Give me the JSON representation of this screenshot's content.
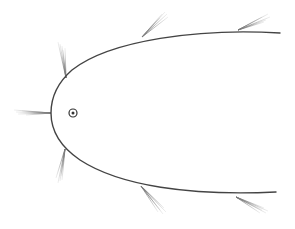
{
  "diagram": {
    "title": "Parabolic reflector with incoming rays and focus point",
    "curve": {
      "stroke": "#444444",
      "stroke_width": 1.4,
      "path": "M 280 33 C 200 28, 110 40, 72 70 C 55 85, 51 100, 51 113 C 51 128, 58 145, 80 160 C 120 186, 190 196, 276 192"
    },
    "focus": {
      "cx": 73,
      "cy": 113,
      "outer_r": 4,
      "inner_r": 1.5,
      "stroke": "#333333"
    },
    "feather_color": "#9a9a9a",
    "feathers": [
      {
        "name": "feather-left",
        "base": [
          51,
          113
        ],
        "tips": [
          [
            14,
            110
          ],
          [
            16,
            112
          ],
          [
            18,
            114
          ],
          [
            22,
            111
          ],
          [
            26,
            115
          ]
        ]
      },
      {
        "name": "feather-upper-left",
        "base": [
          66,
          78
        ],
        "tips": [
          [
            58,
            42
          ],
          [
            60,
            44
          ],
          [
            62,
            46
          ],
          [
            63,
            50
          ],
          [
            65,
            48
          ]
        ]
      },
      {
        "name": "feather-top-middle",
        "base": [
          142,
          37
        ],
        "tips": [
          [
            165,
            12
          ],
          [
            167,
            14
          ],
          [
            168,
            17
          ],
          [
            162,
            14
          ],
          [
            160,
            18
          ]
        ]
      },
      {
        "name": "feather-top-right",
        "base": [
          238,
          30
        ],
        "tips": [
          [
            268,
            14
          ],
          [
            270,
            17
          ],
          [
            266,
            20
          ],
          [
            262,
            17
          ],
          [
            264,
            22
          ]
        ]
      },
      {
        "name": "feather-lower-left",
        "base": [
          65,
          149
        ],
        "tips": [
          [
            58,
            183
          ],
          [
            60,
            181
          ],
          [
            62,
            180
          ],
          [
            56,
            178
          ],
          [
            61,
            176
          ]
        ]
      },
      {
        "name": "feather-bottom-middle",
        "base": [
          141,
          186
        ],
        "tips": [
          [
            163,
            214
          ],
          [
            166,
            212
          ],
          [
            160,
            210
          ],
          [
            164,
            208
          ],
          [
            158,
            212
          ]
        ]
      },
      {
        "name": "feather-bottom-right",
        "base": [
          236,
          197
        ],
        "tips": [
          [
            266,
            213
          ],
          [
            268,
            211
          ],
          [
            262,
            210
          ],
          [
            264,
            208
          ],
          [
            260,
            213
          ]
        ]
      }
    ]
  }
}
